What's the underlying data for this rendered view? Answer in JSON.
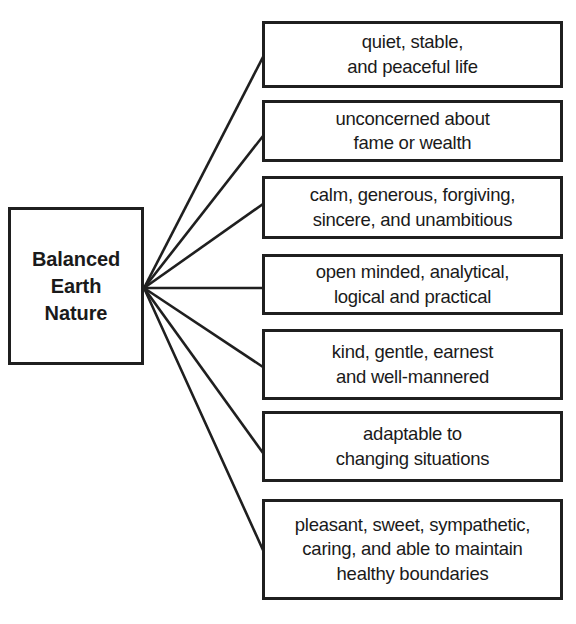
{
  "diagram": {
    "type": "radial-tree",
    "style": {
      "background": "#ffffff",
      "border_color": "#1f1f1f",
      "text_color": "#1a1a1a"
    },
    "root": {
      "label": "Balanced\nEarth\nNature",
      "box": {
        "x": 8,
        "y": 207,
        "width": 136,
        "height": 158
      }
    },
    "hub": {
      "x": 144,
      "y": 288
    },
    "leaves": [
      {
        "label": "quiet, stable,\nand peaceful life",
        "box": {
          "x": 262,
          "y": 21,
          "width": 301,
          "height": 67
        },
        "connect_y": 57
      },
      {
        "label": "unconcerned about\nfame or wealth",
        "box": {
          "x": 262,
          "y": 100,
          "width": 301,
          "height": 62
        },
        "connect_y": 136
      },
      {
        "label": "calm, generous, forgiving,\nsincere, and unambitious",
        "box": {
          "x": 262,
          "y": 176,
          "width": 301,
          "height": 63
        },
        "connect_y": 204
      },
      {
        "label": "open minded, analytical,\nlogical and practical",
        "box": {
          "x": 262,
          "y": 254,
          "width": 301,
          "height": 61
        },
        "connect_y": 288
      },
      {
        "label": "kind, gentle, earnest\nand well-mannered",
        "box": {
          "x": 262,
          "y": 329,
          "width": 301,
          "height": 71
        },
        "connect_y": 367
      },
      {
        "label": "adaptable to\nchanging situations",
        "box": {
          "x": 262,
          "y": 411,
          "width": 301,
          "height": 71
        },
        "connect_y": 453
      },
      {
        "label": "pleasant, sweet, sympathetic,\ncaring, and able to maintain\nhealthy boundaries",
        "box": {
          "x": 262,
          "y": 499,
          "width": 301,
          "height": 101
        },
        "connect_y": 550
      }
    ]
  }
}
